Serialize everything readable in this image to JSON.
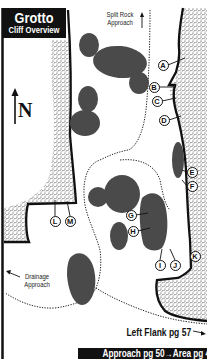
{
  "title": {
    "main": "Grotto",
    "sub": "Cliff Overview"
  },
  "north": {
    "label": "N"
  },
  "labels": {
    "split_rock_line1": "Split Rock",
    "split_rock_line2": "Approach",
    "drainage_line1": "Drainage",
    "drainage_line2": "Approach",
    "left_flank": "Left Flank pg 57",
    "bottom_bar": "Approach pg 50→Area pg 44"
  },
  "markers": [
    {
      "id": "A",
      "x": 163,
      "y": 65
    },
    {
      "id": "B",
      "x": 154,
      "y": 87
    },
    {
      "id": "C",
      "x": 157,
      "y": 101
    },
    {
      "id": "D",
      "x": 164,
      "y": 120
    },
    {
      "id": "E",
      "x": 192,
      "y": 172
    },
    {
      "id": "F",
      "x": 192,
      "y": 186
    },
    {
      "id": "G",
      "x": 131,
      "y": 215
    },
    {
      "id": "H",
      "x": 133,
      "y": 231
    },
    {
      "id": "I",
      "x": 160,
      "y": 265
    },
    {
      "id": "J",
      "x": 175,
      "y": 265
    },
    {
      "id": "K",
      "x": 195,
      "y": 256
    },
    {
      "id": "L",
      "x": 55,
      "y": 221
    },
    {
      "id": "M",
      "x": 70,
      "y": 221
    }
  ],
  "colors": {
    "boulder": "#4a4a4a",
    "stipple": "#2a2a2a",
    "ink": "#111111"
  }
}
